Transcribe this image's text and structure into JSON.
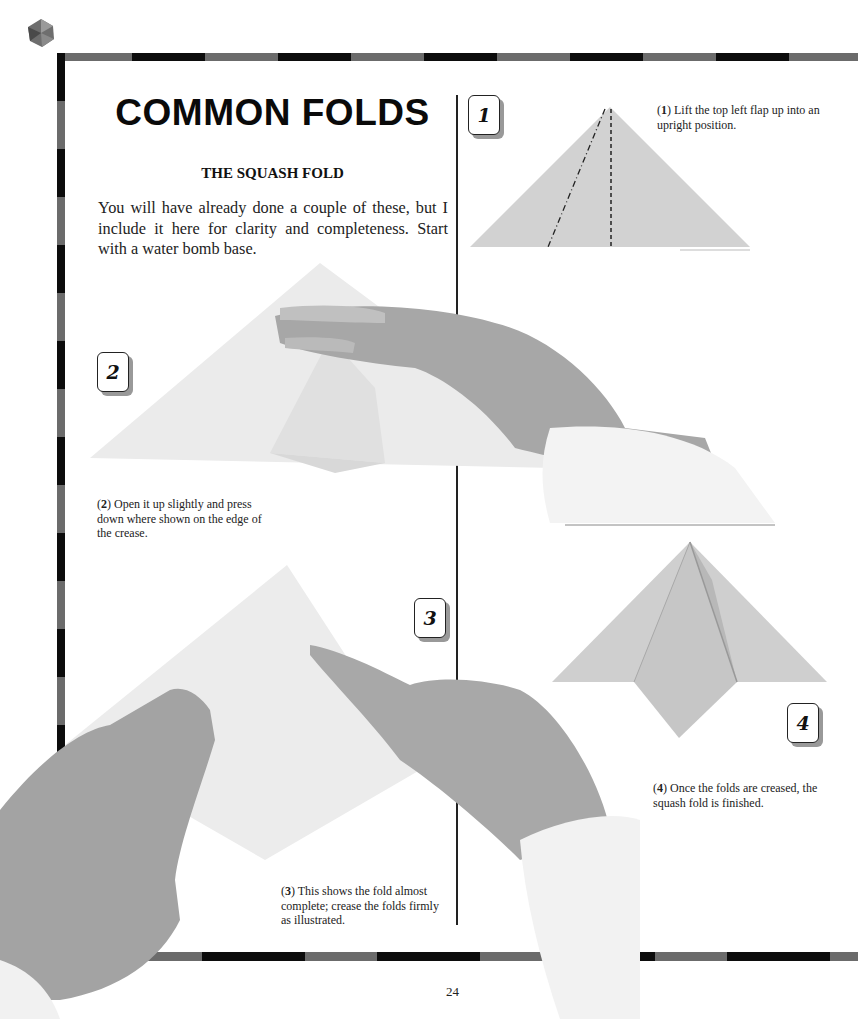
{
  "page": {
    "title": "COMMON FOLDS",
    "subtitle": "THE SQUASH FOLD",
    "intro": "You will have already done a couple of these, but I include it here for clarity and completeness. Start with a water bomb base.",
    "page_number": "24"
  },
  "steps": [
    {
      "number": "1",
      "label": "(1)",
      "bold": "1",
      "text": " Lift the top left flap up into an upright position."
    },
    {
      "number": "2",
      "label": "(2)",
      "bold": "2",
      "text": " Open it up slightly and press down where shown on the edge of the crease."
    },
    {
      "number": "3",
      "label": "(3)",
      "bold": "3",
      "text": " This shows the fold almost complete; crease the folds firmly as illustrated."
    },
    {
      "number": "4",
      "label": "(4)",
      "bold": "4",
      "text": " Once the folds are creased, the squash fold is finished."
    }
  ],
  "colors": {
    "frame_dark": "#0c0c0c",
    "frame_gray": "#6b6b6b",
    "paper_gray": "#d4d4d4",
    "skin": "#9a9a9a",
    "cuff": "#f2f2f2"
  }
}
